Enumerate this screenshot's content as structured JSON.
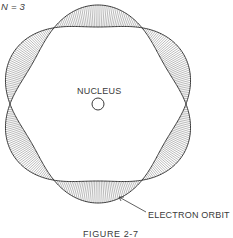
{
  "figure": {
    "quantum_label": "N = 3",
    "nucleus_label": "NUCLEUS",
    "orbit_label": "ELECTRON ORBIT",
    "caption": "FIGURE 2-7"
  },
  "geometry": {
    "center": [
      98,
      104
    ],
    "node_radius": 88,
    "wave_amplitude": 11,
    "node_count": 6,
    "nucleus_radius": 6,
    "stroke_color": "#3a3a3a",
    "hatch_color": "#777777"
  }
}
